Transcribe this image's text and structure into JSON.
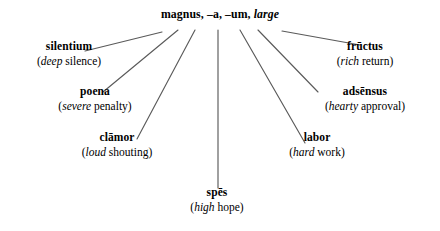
{
  "diagram": {
    "type": "word-association-map",
    "title_node": {
      "term": "magnus, –a, –um,",
      "translation": "large",
      "full": "magnus, –a, –um, large"
    },
    "line_color": "#5a5a5a",
    "text_color": "#000000",
    "background_color": "#ffffff",
    "nodes": [
      {
        "id": "silentium",
        "term": "silentium",
        "qualifier": "deep",
        "gloss_rest": " silence",
        "gloss": "(deep silence)"
      },
      {
        "id": "poena",
        "term": "poena",
        "qualifier": "severe",
        "gloss_rest": " penalty",
        "gloss": "(severe penalty)"
      },
      {
        "id": "clamor",
        "term": "clāmor",
        "qualifier": "loud",
        "gloss_rest": " shouting",
        "gloss": "(loud shouting)"
      },
      {
        "id": "spes",
        "term": "spēs",
        "qualifier": "high",
        "gloss_rest": " hope",
        "gloss": "(high hope)"
      },
      {
        "id": "labor",
        "term": "labor",
        "qualifier": "hard",
        "gloss_rest": " work",
        "gloss": "(hard work)"
      },
      {
        "id": "adsensus",
        "term": "adsēnsus",
        "qualifier": "hearty",
        "gloss_rest": " approval",
        "gloss": "(hearty approval)"
      },
      {
        "id": "fructus",
        "term": "frūctus",
        "qualifier": "rich",
        "gloss_rest": " return",
        "gloss": "(rich return)"
      }
    ]
  }
}
